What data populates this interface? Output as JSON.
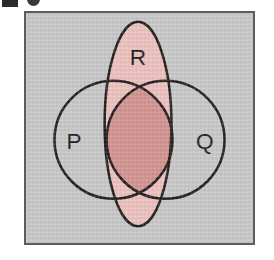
{
  "figure": {
    "type": "venn-diagram",
    "set_count": 3,
    "background_color": "#c9c9c9",
    "frame_border_color": "#5c5c5c",
    "outline_color": "#231f1f",
    "cropped_caption_above": true
  },
  "labels": {
    "p": "P",
    "q": "Q",
    "r": "R"
  },
  "sets": [
    {
      "id": "p",
      "label": "P",
      "shape": "circle",
      "cx": 89,
      "cy": 129,
      "r": 60,
      "fill": "none"
    },
    {
      "id": "q",
      "label": "Q",
      "shape": "circle",
      "cx": 142,
      "cy": 129,
      "r": 60,
      "fill": "none"
    },
    {
      "id": "r",
      "label": "R",
      "shape": "ellipse",
      "cx": 114,
      "cy": 113,
      "rx": 34,
      "ry": 104,
      "fill": "#efc3c0"
    }
  ],
  "shaded_regions": [
    {
      "id": "region-r",
      "description": "R only and R overlaps",
      "expression": "R",
      "color": "#efc3c0",
      "shade": "light-pink"
    },
    {
      "id": "region-pqr",
      "description": "intersection of P, Q and R",
      "expression": "P ∩ Q ∩ R",
      "color": "#d49490",
      "shade": "dark-rose"
    }
  ],
  "label_positions": {
    "p": {
      "x": 49,
      "y": 132
    },
    "q": {
      "x": 182,
      "y": 132
    },
    "r": {
      "x": 114,
      "y": 47
    }
  }
}
